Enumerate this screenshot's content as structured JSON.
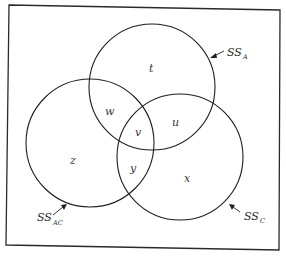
{
  "diagram": {
    "type": "venn",
    "sets": [
      {
        "id": "A",
        "label": "SS",
        "subscript": "A",
        "center": [
          152,
          87
        ],
        "radius": 63
      },
      {
        "id": "AC",
        "label": "SS",
        "subscript": "AC",
        "center": [
          90,
          143
        ],
        "radius": 64
      },
      {
        "id": "C",
        "label": "SS",
        "subscript": "C",
        "center": [
          180,
          157
        ],
        "radius": 63
      }
    ],
    "regions": [
      {
        "id": "t",
        "label": "t",
        "description": "A only"
      },
      {
        "id": "u",
        "label": "u",
        "description": "A and C only"
      },
      {
        "id": "v",
        "label": "v",
        "description": "A, AC and C"
      },
      {
        "id": "w",
        "label": "w",
        "description": "A and AC only"
      },
      {
        "id": "x",
        "label": "x",
        "description": "C only"
      },
      {
        "id": "y",
        "label": "y",
        "description": "AC and C only"
      },
      {
        "id": "z",
        "label": "z",
        "description": "AC only"
      }
    ]
  },
  "labels": {
    "region_t": "t",
    "region_u": "u",
    "region_v": "v",
    "region_w": "w",
    "region_x": "x",
    "region_y": "y",
    "region_z": "z",
    "set_a_main": "SS",
    "set_a_sub": "A",
    "set_ac_main": "SS",
    "set_ac_sub": "AC",
    "set_c_main": "SS",
    "set_c_sub": "C"
  }
}
